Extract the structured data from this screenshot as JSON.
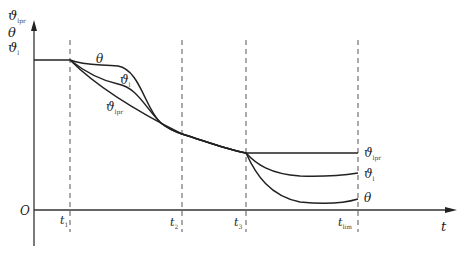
{
  "diagram": {
    "y_axis_labels": [
      {
        "base": "ϑ",
        "sub": "lpr"
      },
      {
        "base": "θ",
        "sub": ""
      },
      {
        "base": "ϑ",
        "sub": "l"
      }
    ],
    "origin_label": "O",
    "x_axis_label": "t",
    "time_markers": [
      {
        "base": "t",
        "sub": "1"
      },
      {
        "base": "t",
        "sub": "2"
      },
      {
        "base": "t",
        "sub": "3"
      },
      {
        "base": "t",
        "sub": "lim"
      }
    ],
    "curves": [
      {
        "name": "theta",
        "base": "θ",
        "sub": "",
        "color": "#222222"
      },
      {
        "name": "theta-l",
        "base": "ϑ",
        "sub": "l",
        "color": "#222222"
      },
      {
        "name": "theta-lpr",
        "base": "ϑ",
        "sub": "lpr",
        "color": "#222222"
      }
    ],
    "end_labels": [
      {
        "base": "ϑ",
        "sub": "lpr"
      },
      {
        "base": "ϑ",
        "sub": "l"
      },
      {
        "base": "θ",
        "sub": ""
      }
    ],
    "caption": ""
  }
}
